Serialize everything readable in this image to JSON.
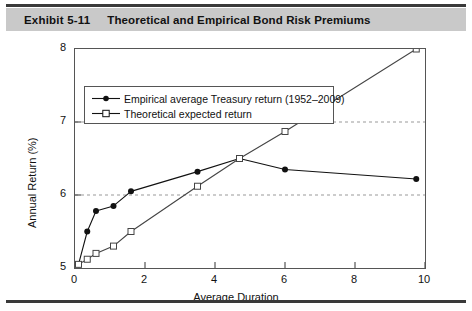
{
  "exhibit": {
    "number_label": "Exhibit 5-11",
    "title": "Theoretical and Empirical Bond Risk Premiums"
  },
  "colors": {
    "title_bar_bg": "#c9c9c9",
    "rule": "#3a3a3a",
    "axis": "#555555",
    "series_empirical": "#111111",
    "series_theoretical": "#444444",
    "gridline": "#999999"
  },
  "chart_data": {
    "type": "line",
    "title": "Theoretical and Empirical Bond Risk Premiums",
    "xlabel": "Average Duration",
    "ylabel": "Annual Return (%)",
    "xlim": [
      0,
      10
    ],
    "ylim": [
      5,
      8
    ],
    "xticks": [
      0,
      2,
      4,
      6,
      8,
      10
    ],
    "yticks": [
      5,
      6,
      7,
      8
    ],
    "xtick_labels": [
      "0",
      "2",
      "4",
      "6",
      "8",
      "10"
    ],
    "ytick_labels": [
      "5",
      "6",
      "7",
      "8"
    ],
    "grid": "horizontal-dashed at y=6 and y=7",
    "gridlines_y": [
      6,
      7
    ],
    "legend_position": "upper-left-inside",
    "series": [
      {
        "name": "Empirical average Treasury return (1952–2009)",
        "marker": "filled-circle",
        "x": [
          0.1,
          0.35,
          0.6,
          1.1,
          1.6,
          3.5,
          4.7,
          6.0,
          9.75
        ],
        "values": [
          5.05,
          5.5,
          5.78,
          5.85,
          6.05,
          6.32,
          6.5,
          6.35,
          6.22
        ]
      },
      {
        "name": "Theoretical expected return",
        "marker": "open-square",
        "x": [
          0.1,
          0.35,
          0.6,
          1.1,
          1.6,
          3.5,
          4.7,
          6.0,
          9.75
        ],
        "values": [
          5.05,
          5.12,
          5.2,
          5.3,
          5.5,
          6.12,
          6.5,
          6.87,
          8.0
        ]
      }
    ]
  }
}
